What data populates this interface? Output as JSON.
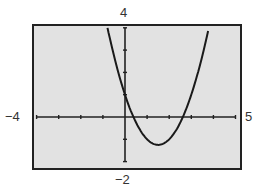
{
  "chart_data": {
    "type": "line",
    "title": "",
    "xlabel": "",
    "ylabel": "",
    "function": "y = x^2 - 3x + 1",
    "xlim": [
      -4,
      5
    ],
    "ylim": [
      -2,
      4
    ],
    "xscale": 1,
    "yscale": 1,
    "grid": false,
    "window_labels": {
      "xmin": "−4",
      "xmax": "5",
      "ymin": "−2",
      "ymax": "4"
    },
    "series": [
      {
        "name": "parabola",
        "x": [
          -0.79,
          -0.5,
          0,
          0.38,
          0.5,
          1,
          1.5,
          2,
          2.5,
          2.62,
          3,
          3.5,
          3.79
        ],
        "y": [
          4.0,
          2.75,
          1.0,
          0.0,
          -0.25,
          -1.0,
          -1.25,
          -1.0,
          -0.25,
          0.0,
          1.0,
          2.75,
          4.0
        ]
      }
    ],
    "annotations": {
      "y_intercept": [
        0,
        1
      ],
      "x_intercepts": [
        0.38,
        2.62
      ],
      "vertex": [
        1.5,
        -1.25
      ]
    }
  },
  "colors": {
    "screen_background": "#e2e2e2",
    "frame": "#222222",
    "axes": "#222222",
    "curve": "#1a1a1a",
    "labels": "#333333"
  }
}
